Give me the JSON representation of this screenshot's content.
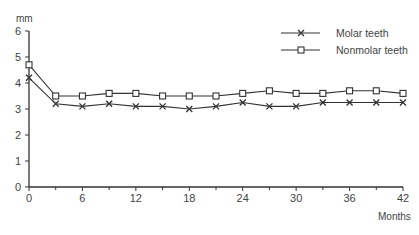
{
  "chart_data": {
    "type": "line",
    "title": "",
    "xlabel": "Months",
    "ylabel": "mm",
    "x": [
      0,
      3,
      6,
      9,
      12,
      15,
      18,
      21,
      24,
      27,
      30,
      33,
      36,
      39,
      42
    ],
    "xticks": [
      0,
      6,
      12,
      18,
      24,
      30,
      36,
      42
    ],
    "yticks": [
      0,
      1,
      2,
      3,
      4,
      5,
      6
    ],
    "xlim": [
      0,
      42
    ],
    "ylim": [
      0,
      6
    ],
    "grid": false,
    "legend_position": "top-right",
    "series": [
      {
        "name": "Molar teeth",
        "marker": "x",
        "values": [
          4.2,
          3.2,
          3.1,
          3.2,
          3.1,
          3.1,
          3.0,
          3.1,
          3.25,
          3.1,
          3.1,
          3.25,
          3.25,
          3.25,
          3.25
        ]
      },
      {
        "name": "Nonmolar teeth",
        "marker": "square",
        "values": [
          4.7,
          3.5,
          3.5,
          3.6,
          3.6,
          3.5,
          3.5,
          3.5,
          3.6,
          3.7,
          3.6,
          3.6,
          3.7,
          3.7,
          3.6
        ]
      }
    ]
  },
  "legend": {
    "items": [
      "Molar teeth",
      "Nonmolar teeth"
    ]
  },
  "axes": {
    "y_unit": "mm",
    "x_unit": "Months"
  }
}
